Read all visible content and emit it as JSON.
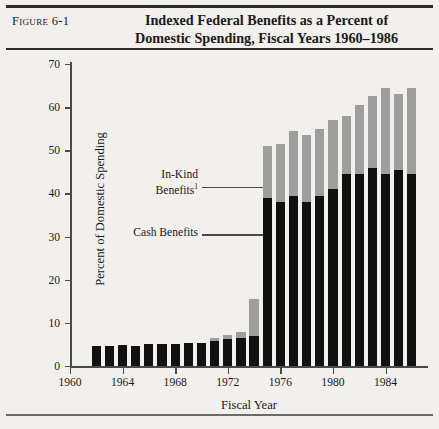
{
  "figure": {
    "label": "Figure 6-1",
    "title_line1": "Indexed Federal Benefits as a Percent of",
    "title_line2": "Domestic Spending, Fiscal Years 1960–1986"
  },
  "annotations": {
    "in_kind_line1": "In-Kind",
    "in_kind_line2": "Benefits",
    "in_kind_footnote": "1",
    "cash": "Cash Benefits"
  },
  "colors": {
    "cash_benefits": "#111111",
    "in_kind_benefits": "#9e9e9e",
    "axis": "#4a4a4a",
    "page_background": "#f2f0ec"
  },
  "chart_data": {
    "type": "bar",
    "stacked": true,
    "title": "Indexed Federal Benefits as a Percent of Domestic Spending, Fiscal Years 1960–1986",
    "xlabel": "Fiscal Year",
    "ylabel": "Percent of Domestic Spending",
    "ylim": [
      0,
      70
    ],
    "yticks": [
      0,
      10,
      20,
      30,
      40,
      50,
      60,
      70
    ],
    "xlim": [
      1960,
      1987
    ],
    "xticks": [
      1960,
      1964,
      1968,
      1972,
      1976,
      1980,
      1984
    ],
    "grid": false,
    "legend_position": "inline-annotations",
    "categories": [
      1962,
      1963,
      1964,
      1965,
      1966,
      1967,
      1968,
      1969,
      1970,
      1971,
      1972,
      1973,
      1974,
      1975,
      1976,
      1977,
      1978,
      1979,
      1980,
      1981,
      1982,
      1983,
      1984,
      1985,
      1986
    ],
    "series": [
      {
        "name": "Cash Benefits",
        "values": [
          4.6,
          4.6,
          4.8,
          4.7,
          5.0,
          5.0,
          5.0,
          5.4,
          5.4,
          5.7,
          6.2,
          6.5,
          7.0,
          39.0,
          38.0,
          39.5,
          38.0,
          39.5,
          41.0,
          44.5,
          44.5,
          46.0,
          44.5,
          45.5,
          44.5
        ]
      },
      {
        "name": "In-Kind Benefits",
        "values": [
          0.0,
          0.0,
          0.0,
          0.0,
          0.0,
          0.0,
          0.0,
          0.0,
          0.0,
          0.8,
          1.1,
          1.3,
          8.5,
          12.0,
          13.5,
          15.0,
          15.5,
          15.5,
          16.0,
          13.5,
          16.0,
          16.5,
          20.0,
          17.5,
          20.0
        ]
      }
    ],
    "totals": [
      4.6,
      4.6,
      4.8,
      4.7,
      5.0,
      5.0,
      5.0,
      5.4,
      5.4,
      6.5,
      7.3,
      7.8,
      15.5,
      51.0,
      51.5,
      54.5,
      53.5,
      55.0,
      57.0,
      58.0,
      60.5,
      62.5,
      64.5,
      63.0,
      64.5
    ]
  }
}
